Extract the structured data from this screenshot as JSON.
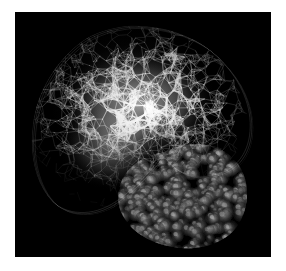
{
  "window": {
    "background_color": "#ffffff",
    "frame_color": "#ffffff"
  },
  "viewport": {
    "background_color": "#000000",
    "x": 15,
    "y": 12,
    "width": 256,
    "height": 245,
    "label": "molecular-render-viewport"
  },
  "render": {
    "title": "",
    "style": "grayscale molecular graphics render",
    "representations": [
      {
        "name": "wireframe-mesh",
        "description": "bright polygonal wire mesh network forming a crescent shell",
        "color": "#e8e8e8",
        "rim_color": "#bfbfbf",
        "core_color": "#f2f2f2",
        "region": "upper-left crescent"
      },
      {
        "name": "space-filling-spheres",
        "description": "dim gray CPK spheres cluster",
        "color": "#5a5a5a",
        "highlight_color": "#9a9a9a",
        "region": "lower-right lobe"
      }
    ],
    "background_color": "#000000",
    "accent_color": "#d9d9d9"
  },
  "chart_data": {
    "type": "scatter",
    "title": "",
    "xlabel": "",
    "ylabel": "",
    "grid": false,
    "legend": "none",
    "series": [
      {
        "name": "wireframe-mesh-nodes",
        "color": "#e6e6e6",
        "count": 1400
      },
      {
        "name": "space-filling-spheres",
        "color": "#6e6e6e",
        "count": 330
      }
    ]
  }
}
